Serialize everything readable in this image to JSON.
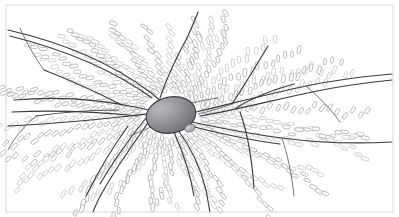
{
  "figure": {
    "caption": "",
    "width": 399,
    "height": 217,
    "background_color": "#ffffff"
  },
  "frame": {
    "stroke_color": "#cfcfcf",
    "x": 6,
    "y": 5,
    "width": 387,
    "height": 207
  },
  "nucleus": {
    "label": "central-shaded-ellipse",
    "cx": 171,
    "cy": 115,
    "rx": 25,
    "ry": 18,
    "rotation": -12,
    "fill_light": "#b9b9bd",
    "fill_dark": "#6e6e74",
    "outline_color": "#3c3c42"
  },
  "satellite": {
    "label": "small-shaded-ellipse",
    "cx": 190,
    "cy": 128,
    "rx": 5.5,
    "ry": 3.6,
    "rotation": -25,
    "fill_light": "#d2d2d6",
    "fill_dark": "#9a9aa0",
    "outline_color": "#6a6a70"
  },
  "palette": {
    "chain_stroke": "#8e8e94",
    "chain_stroke_faint": "#a8a8ae",
    "chain_fill": "#ffffff",
    "vein_stroke": "#3a3a40",
    "vein_thin_stroke": "#55555c"
  },
  "filaments": {
    "note": "Chains of elongated rounded cells radiating outward from the central body",
    "cell_length": 7.2,
    "cell_width": 3.2,
    "cell_corner_radius": 1.5,
    "origin": {
      "x": 171,
      "y": 115
    },
    "inner_radius": 30,
    "rays": [
      {
        "angle": 186,
        "length": 160,
        "cells": 20,
        "faint": false
      },
      {
        "angle": 194,
        "length": 158,
        "cells": 20,
        "faint": false
      },
      {
        "angle": 202,
        "length": 152,
        "cells": 19,
        "faint": true
      },
      {
        "angle": 210,
        "length": 146,
        "cells": 18,
        "faint": false
      },
      {
        "angle": 218,
        "length": 140,
        "cells": 17,
        "faint": true
      },
      {
        "angle": 226,
        "length": 132,
        "cells": 16,
        "faint": false
      },
      {
        "angle": 234,
        "length": 124,
        "cells": 15,
        "faint": true
      },
      {
        "angle": 242,
        "length": 116,
        "cells": 14,
        "faint": false
      },
      {
        "angle": 250,
        "length": 108,
        "cells": 13,
        "faint": true
      },
      {
        "angle": 258,
        "length": 100,
        "cells": 12,
        "faint": false
      },
      {
        "angle": 266,
        "length": 96,
        "cells": 11,
        "faint": true
      },
      {
        "angle": 274,
        "length": 96,
        "cells": 11,
        "faint": false
      },
      {
        "angle": 282,
        "length": 98,
        "cells": 12,
        "faint": true
      },
      {
        "angle": 290,
        "length": 104,
        "cells": 13,
        "faint": false
      },
      {
        "angle": 298,
        "length": 112,
        "cells": 14,
        "faint": true
      },
      {
        "angle": 306,
        "length": 120,
        "cells": 15,
        "faint": false
      },
      {
        "angle": 314,
        "length": 130,
        "cells": 16,
        "faint": true
      },
      {
        "angle": 322,
        "length": 142,
        "cells": 17,
        "faint": false
      },
      {
        "angle": 330,
        "length": 154,
        "cells": 19,
        "faint": true
      },
      {
        "angle": 338,
        "length": 168,
        "cells": 21,
        "faint": false
      },
      {
        "angle": 346,
        "length": 180,
        "cells": 22,
        "faint": true
      },
      {
        "angle": 354,
        "length": 190,
        "cells": 23,
        "faint": false
      },
      {
        "angle": 2,
        "length": 196,
        "cells": 24,
        "faint": true
      },
      {
        "angle": 10,
        "length": 192,
        "cells": 23,
        "faint": false
      },
      {
        "angle": 18,
        "length": 184,
        "cells": 22,
        "faint": true
      },
      {
        "angle": 26,
        "length": 172,
        "cells": 21,
        "faint": false
      },
      {
        "angle": 34,
        "length": 158,
        "cells": 19,
        "faint": true
      },
      {
        "angle": 42,
        "length": 144,
        "cells": 18,
        "faint": false
      },
      {
        "angle": 50,
        "length": 130,
        "cells": 16,
        "faint": true
      },
      {
        "angle": 58,
        "length": 118,
        "cells": 14,
        "faint": false
      },
      {
        "angle": 66,
        "length": 108,
        "cells": 13,
        "faint": true
      },
      {
        "angle": 74,
        "length": 100,
        "cells": 12,
        "faint": false
      },
      {
        "angle": 82,
        "length": 96,
        "cells": 11,
        "faint": true
      },
      {
        "angle": 90,
        "length": 96,
        "cells": 11,
        "faint": false
      },
      {
        "angle": 98,
        "length": 98,
        "cells": 12,
        "faint": true
      },
      {
        "angle": 106,
        "length": 104,
        "cells": 13,
        "faint": false
      },
      {
        "angle": 114,
        "length": 112,
        "cells": 14,
        "faint": true
      },
      {
        "angle": 122,
        "length": 122,
        "cells": 15,
        "faint": false
      },
      {
        "angle": 130,
        "length": 132,
        "cells": 16,
        "faint": true
      },
      {
        "angle": 138,
        "length": 144,
        "cells": 18,
        "faint": false
      },
      {
        "angle": 146,
        "length": 156,
        "cells": 19,
        "faint": true
      },
      {
        "angle": 154,
        "length": 168,
        "cells": 20,
        "faint": false
      },
      {
        "angle": 162,
        "length": 176,
        "cells": 21,
        "faint": true
      },
      {
        "angle": 170,
        "length": 180,
        "cells": 22,
        "faint": false
      },
      {
        "angle": 178,
        "length": 176,
        "cells": 21,
        "faint": true
      }
    ]
  },
  "veins": {
    "note": "Darker continuous branching lines overlaying the filament field",
    "paths": [
      "M 8 30 C 60 42, 110 62, 150 92 C 160 100, 166 106, 172 110",
      "M 10 36 C 62 49, 112 69, 152 98",
      "M 14 100 C 60 96, 104 100, 140 108 C 152 111, 162 113, 171 114",
      "M 12 112 C 56 110, 100 112, 138 116",
      "M 8 126 C 48 124, 92 120, 130 116 C 144 114, 158 113, 170 114",
      "M 196 112 C 230 104, 268 94, 306 86 C 340 79, 368 76, 392 74",
      "M 200 116 C 236 110, 274 100, 312 92 C 346 85, 372 82, 392 80",
      "M 192 122 C 220 128, 250 134, 282 138 C 320 143, 356 144, 392 142",
      "M 190 126 C 218 133, 248 140, 280 144",
      "M 178 130 C 190 146, 200 166, 206 190 C 208 200, 209 208, 210 212",
      "M 174 132 C 182 150, 190 172, 194 196",
      "M 150 120 C 136 140, 120 162, 106 186 C 100 196, 96 204, 93 212",
      "M 146 118 C 130 138, 114 160, 100 184",
      "M 160 98 C 166 80, 176 58, 188 36 C 192 26, 196 18, 198 12",
      "M 232 104 C 244 86, 256 66, 268 46",
      "M 236 108 C 252 98, 272 90, 294 84",
      "M 240 112 C 248 134, 252 160, 254 188",
      "M 120 104 C 96 92, 70 80, 44 70",
      "M 118 110 C 92 110, 64 112, 36 116",
      "M 128 126 C 112 148, 98 172, 86 196"
    ],
    "thin_paths": [
      "M 172 110 C 186 104, 202 100, 218 98",
      "M 171 118 C 158 124, 144 130, 130 136",
      "M 232 104 C 220 108, 208 112, 198 114",
      "M 306 86 C 318 96, 330 108, 340 122",
      "M 282 138 C 288 156, 292 176, 294 196",
      "M 44 70 C 34 56, 26 42, 20 28",
      "M 36 116 C 24 126, 14 138, 8 150"
    ]
  }
}
